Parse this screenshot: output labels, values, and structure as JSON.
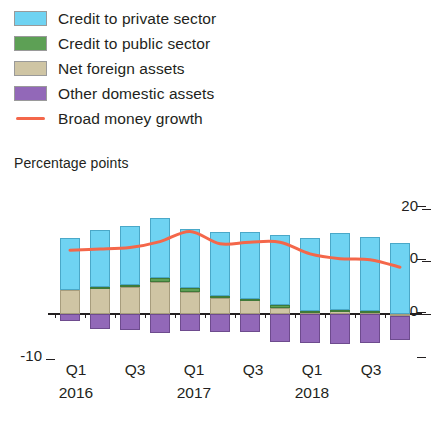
{
  "legend": {
    "items": [
      {
        "label": "Credit to private sector",
        "color": "#6fd3f2",
        "type": "swatch",
        "icon": "legend-swatch-credit-private"
      },
      {
        "label": "Credit to public sector",
        "color": "#5da055",
        "type": "swatch",
        "icon": "legend-swatch-credit-public"
      },
      {
        "label": "Net foreign assets",
        "color": "#cfc5a4",
        "type": "swatch",
        "icon": "legend-swatch-net-foreign-assets"
      },
      {
        "label": "Other domestic assets",
        "color": "#9268b8",
        "type": "swatch",
        "icon": "legend-swatch-other-domestic-assets"
      },
      {
        "label": "Broad money growth",
        "color": "#f4674a",
        "type": "line",
        "icon": "legend-line-broad-money-growth"
      }
    ]
  },
  "axis": {
    "y_title": "Percentage points",
    "y_ticks": [
      "20",
      "10",
      "0",
      "-10"
    ],
    "x_quarters": [
      "Q1",
      "Q3",
      "Q1",
      "Q3",
      "Q1",
      "Q3"
    ],
    "x_years": [
      "2016",
      "2017",
      "2018"
    ]
  },
  "chart_data": {
    "type": "bar",
    "stacked": true,
    "title": "",
    "subtitle": "",
    "xlabel": "",
    "ylabel": "Percentage points",
    "ylim": [
      -10,
      20
    ],
    "yticks": [
      -10,
      0,
      10,
      20
    ],
    "grid": false,
    "legend_position": "top-left",
    "categories": [
      "2016 Q1",
      "2016 Q2",
      "2016 Q3",
      "2016 Q4",
      "2017 Q1",
      "2017 Q2",
      "2017 Q3",
      "2017 Q4",
      "2018 Q1",
      "2018 Q2",
      "2018 Q3",
      "2018 Q4"
    ],
    "series": [
      {
        "name": "Credit to private sector",
        "color": "#6fd3f2",
        "values": [
          9.7,
          10.6,
          11.0,
          11.2,
          11.2,
          12.1,
          12.6,
          13.2,
          13.6,
          14.4,
          13.9,
          13.3
        ]
      },
      {
        "name": "Credit to public sector",
        "color": "#5da055",
        "values": [
          0.0,
          0.3,
          0.5,
          0.8,
          0.6,
          0.4,
          0.3,
          0.5,
          0.4,
          0.3,
          0.2,
          0.0
        ]
      },
      {
        "name": "Net foreign assets",
        "color": "#cfc5a4",
        "values": [
          4.5,
          4.8,
          5.0,
          6.0,
          4.2,
          3.0,
          2.6,
          1.1,
          0.2,
          0.5,
          0.3,
          -0.3
        ]
      },
      {
        "name": "Other domestic assets",
        "color": "#9268b8",
        "values": [
          -1.3,
          -2.8,
          -3.0,
          -3.5,
          -3.2,
          -3.3,
          -3.4,
          -5.2,
          -5.5,
          -5.7,
          -5.5,
          -4.6
        ]
      }
    ],
    "line_series": {
      "name": "Broad money growth",
      "color": "#f4674a",
      "values": [
        12.0,
        12.2,
        12.5,
        13.6,
        15.5,
        13.2,
        13.5,
        13.5,
        11.3,
        10.4,
        10.2,
        8.8
      ]
    }
  }
}
